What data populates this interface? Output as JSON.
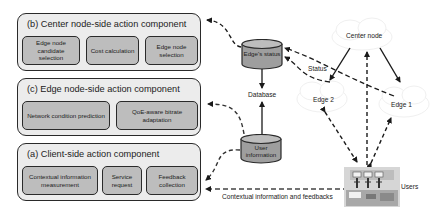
{
  "components": {
    "b": {
      "title": "(b) Center node-side action component",
      "items": [
        "Edge node candidate selection",
        "Cost calculation",
        "Edge node selection"
      ]
    },
    "c": {
      "title": "(c) Edge node-side action component",
      "items": [
        "Network condition prediction",
        "QoE-aware bitrate adaptation"
      ]
    },
    "a": {
      "title": "(a) Client-side action component",
      "items": [
        "Contextual information measurement",
        "Service request",
        "Feedback collection"
      ]
    }
  },
  "storage": {
    "edge_status": "Edge's status",
    "database": "Database",
    "user_information": "User information"
  },
  "nodes": {
    "center": "Center node",
    "edge2": "Edge 2",
    "edge1": "Edge 1",
    "users": "Users"
  },
  "edge_labels": {
    "status": "Status",
    "contextual": "Contextual information and feedbacks"
  },
  "colors": {
    "panel_bg": "#ececec",
    "sub_bg": "#bdbdbd",
    "cylinder": "#9e9e9e",
    "stroke": "#2a2a2a"
  }
}
